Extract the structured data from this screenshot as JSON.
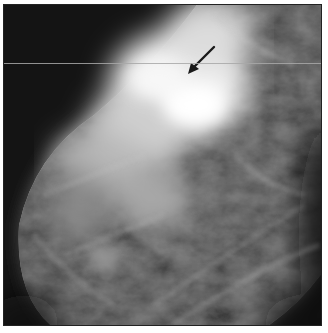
{
  "image": {
    "subject": "mammogram",
    "alt": "Grayscale mammographic image with dense bright fibroglandular tissue in the upper center and a black arrow pointing to a region of density",
    "annotation": {
      "type": "arrow",
      "color": "#1a1a1a",
      "tail": [
        213,
        46
      ],
      "tip": [
        189,
        71
      ]
    },
    "artifact": {
      "type": "horizontal-line",
      "y": 62,
      "color": "#a8a8a8"
    },
    "colors": {
      "background": "#111111",
      "tissue_bright": "#f2f2f2",
      "tissue_mid": "#8a8a8a",
      "margin": "#ffffff"
    }
  }
}
